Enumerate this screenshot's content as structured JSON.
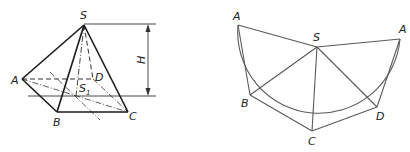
{
  "left_figure": {
    "description": "Oblique pyramid S-ABCD with height H",
    "labels": {
      "apex": "S",
      "a": "A",
      "b": "B",
      "c": "C",
      "d": "D",
      "foot": "S",
      "foot_sub": "1",
      "height": "H"
    },
    "colors": {
      "solid": "#1a1a1a",
      "hidden": "#444444",
      "dim": "#333333"
    }
  },
  "right_figure": {
    "description": "Development (net) of the pyramid lateral surface",
    "labels": {
      "a_left": "A",
      "s": "S",
      "a_right": "A",
      "b": "B",
      "c": "C",
      "d": "D"
    },
    "colors": {
      "line": "#555555"
    }
  }
}
